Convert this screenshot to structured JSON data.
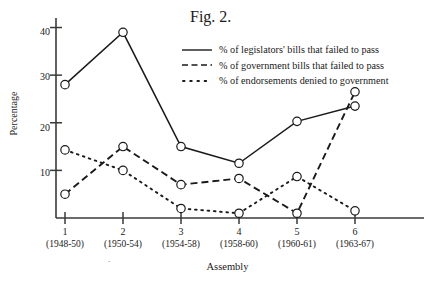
{
  "title": "Fig. 2.",
  "axis": {
    "ylabel": "Percentage",
    "xlabel": "Assembly",
    "yticks": [
      "40",
      "30",
      "20",
      "10"
    ],
    "xticks": [
      {
        "n": "1",
        "years": "(1948-50)"
      },
      {
        "n": "2",
        "years": "(1950-54)"
      },
      {
        "n": "3",
        "years": "(1954-58)"
      },
      {
        "n": "4",
        "years": "(1958-60)"
      },
      {
        "n": "5",
        "years": "(1960-61)"
      },
      {
        "n": "6",
        "years": "(1963-67)"
      }
    ]
  },
  "legend": [
    {
      "style": "solid",
      "label": "% of legislators' bills that failed to pass"
    },
    {
      "style": "dashed",
      "label": "% of government bills that failed to pass"
    },
    {
      "style": "dotted",
      "label": "% of endorsements denied to government"
    }
  ],
  "colors": {
    "ink": "#1a1a1a",
    "axis": "#3a3a3a",
    "marker_fill": "#ffffff"
  },
  "chart_data": {
    "type": "line",
    "title": "Fig. 2.",
    "xlabel": "Assembly",
    "ylabel": "Percentage",
    "categories": [
      "1",
      "2",
      "3",
      "4",
      "5",
      "6"
    ],
    "category_sublabels": [
      "(1948-50)",
      "(1950-54)",
      "(1954-58)",
      "(1958-60)",
      "(1960-61)",
      "(1963-67)"
    ],
    "ylim": [
      0,
      42
    ],
    "yticks": [
      10,
      20,
      30,
      40
    ],
    "grid": false,
    "legend_position": "top-right",
    "markers": "open-circle",
    "series": [
      {
        "name": "% of legislators' bills that failed to pass",
        "style": "solid",
        "values": [
          28,
          39,
          15,
          11.5,
          20.3,
          23.5
        ]
      },
      {
        "name": "% of government bills that failed to pass",
        "style": "dashed",
        "values": [
          5,
          15,
          7,
          8.3,
          1,
          26.5
        ]
      },
      {
        "name": "% of endorsements denied to government",
        "style": "dotted",
        "values": [
          14.3,
          10,
          2,
          1,
          8.7,
          1.5
        ]
      }
    ]
  }
}
